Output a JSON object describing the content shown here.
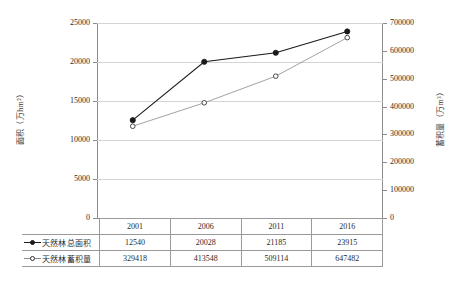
{
  "chart_data": {
    "type": "line",
    "title": "",
    "xlabel": "",
    "ylabel": "面积（万hm²）",
    "y2label": "蓄积量（万m³）",
    "categories": [
      "2001",
      "2006",
      "2011",
      "2016"
    ],
    "grid": true,
    "legend_position": "table-below",
    "axes": {
      "left": {
        "label": "面积（万hm²）",
        "ylim": [
          0,
          25000
        ],
        "ticks": [
          0,
          5000,
          10000,
          15000,
          20000,
          25000
        ],
        "tick_labels": [
          "0",
          "5000",
          "10000",
          "15000",
          "20000",
          "25000"
        ]
      },
      "right": {
        "label": "蓄积量（万m³）",
        "ylim": [
          0,
          700000
        ],
        "ticks": [
          0,
          100000,
          200000,
          300000,
          400000,
          500000,
          600000,
          700000
        ],
        "tick_labels": [
          "0",
          "100000",
          "200000",
          "300000",
          "400000",
          "500000",
          "600000",
          "700000"
        ]
      }
    },
    "series": [
      {
        "name": "天然林总面积",
        "axis": "left",
        "marker": "filled-circle",
        "color": "#1a1a1a",
        "values": [
          12540,
          20028,
          21185,
          23915
        ]
      },
      {
        "name": "天然林蓄积量",
        "axis": "right",
        "marker": "open-circle",
        "color": "#8a8a8a",
        "values": [
          329418,
          413548,
          509114,
          647482
        ]
      }
    ]
  },
  "table": {
    "header_row": {
      "corner_label": "",
      "years": [
        "2001",
        "2006",
        "2011",
        "2016"
      ]
    },
    "rows": [
      {
        "legend_marker": "filled-circle-line",
        "label": "天然林总面积",
        "cells": [
          "12540",
          "20028",
          "21185",
          "23915"
        ]
      },
      {
        "legend_marker": "open-circle-line",
        "label": "天然林蓄积量",
        "cells": [
          "329418",
          "413548",
          "509114",
          "647482"
        ]
      }
    ]
  }
}
